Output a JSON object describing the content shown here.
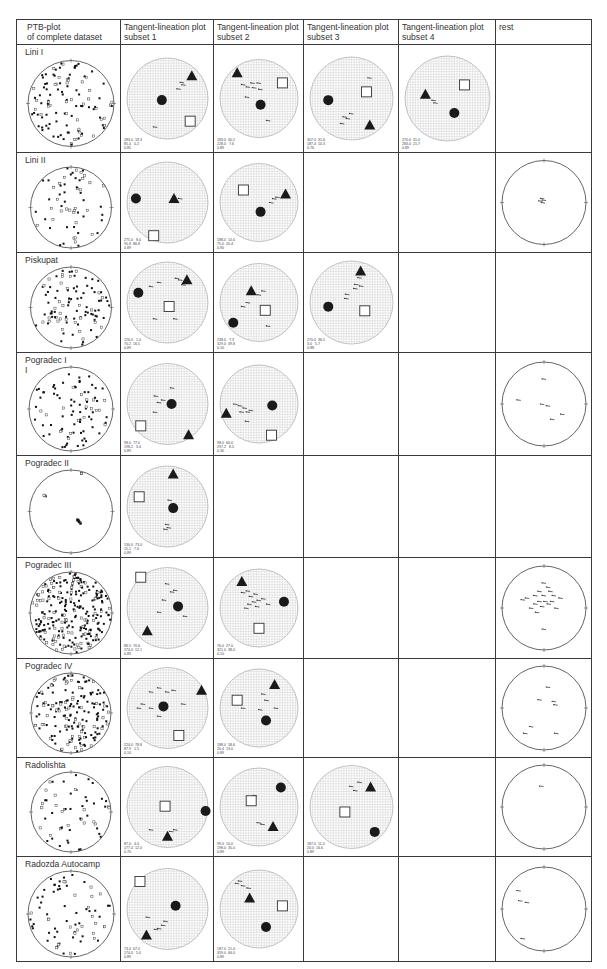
{
  "header": {
    "columns": [
      {
        "label": "PTB-plot\nof complete dataset"
      },
      {
        "label": "Tangent-lineation plot\nsubset 1"
      },
      {
        "label": "Tangent-lineation plot\nsubset 2"
      },
      {
        "label": "Tangent-lineation plot\nsubset 3"
      },
      {
        "label": "Tangent-lineation plot\nsubset 4"
      },
      {
        "label": "rest"
      }
    ]
  },
  "layout": {
    "col_widths": [
      104,
      93,
      90,
      95,
      97,
      96
    ],
    "row_heights": [
      107,
      99,
      99,
      102,
      101,
      100,
      98,
      98,
      104
    ]
  },
  "colors": {
    "border": "#3a3a3a",
    "grid": "#c8c8c8",
    "marker": "#1a1a1a",
    "circle_outline": "#555555"
  },
  "rows": [
    {
      "label": "Lini I",
      "ptb": {
        "density": 110,
        "seed": 11,
        "squares_ratio": 0.3
      },
      "subsets": [
        {
          "circle": [
            0.43,
            0.52
          ],
          "triangle": [
            0.8,
            0.22
          ],
          "square": [
            0.78,
            0.78
          ],
          "ticks": [
            [
              0.68,
              0.3
            ],
            [
              0.7,
              0.33
            ],
            [
              0.64,
              0.38
            ],
            [
              0.35,
              0.85
            ]
          ],
          "stats": "283.0  18.3\n85.4   0.2\n0.85"
        },
        {
          "circle": [
            0.52,
            0.58
          ],
          "triangle": [
            0.22,
            0.17
          ],
          "square": [
            0.8,
            0.3
          ],
          "ticks": [
            [
              0.3,
              0.32
            ],
            [
              0.36,
              0.35
            ],
            [
              0.42,
              0.3
            ],
            [
              0.44,
              0.36
            ],
            [
              0.5,
              0.3
            ],
            [
              0.52,
              0.38
            ],
            [
              0.35,
              0.48
            ],
            [
              0.62,
              0.78
            ]
          ],
          "stats": "183.0  40.2\n228.0   7.6\n0.89"
        },
        {
          "circle": [
            0.22,
            0.52
          ],
          "triangle": [
            0.72,
            0.82
          ],
          "square": [
            0.68,
            0.42
          ],
          "ticks": [
            [
              0.72,
              0.25
            ],
            [
              0.5,
              0.68
            ],
            [
              0.42,
              0.72
            ],
            [
              0.46,
              0.74
            ],
            [
              0.39,
              0.8
            ]
          ],
          "stats": "307.0  31.6\n187.4  10.3\n0.76"
        },
        {
          "circle": [
            0.58,
            0.67
          ],
          "triangle": [
            0.24,
            0.45
          ],
          "square": [
            0.7,
            0.34
          ],
          "ticks": [
            [
              0.34,
              0.52
            ],
            [
              0.36,
              0.55
            ]
          ],
          "stats": "270.0  31.0\n283.0  21.7\n0.89"
        },
        null
      ]
    },
    {
      "label": "Lini II",
      "ptb": {
        "density": 60,
        "seed": 22,
        "squares_ratio": 0.3
      },
      "subsets": [
        {
          "circle": [
            0.11,
            0.45
          ],
          "triangle": [
            0.58,
            0.45
          ],
          "square": [
            0.33,
            0.91
          ],
          "ticks": [
            [
              0.66,
              0.45
            ]
          ],
          "stats": "275.0   8.0\n95.8  86.8\n0.89"
        },
        {
          "circle": [
            0.52,
            0.62
          ],
          "triangle": [
            0.84,
            0.39
          ],
          "square": [
            0.3,
            0.34
          ],
          "ticks": [
            [
              0.7,
              0.45
            ],
            [
              0.74,
              0.43
            ],
            [
              0.66,
              0.5
            ]
          ],
          "stats": "188.0  10.0\n75.0  20.4\n0.90"
        },
        null,
        null,
        {
          "rest_ticks": [
            [
              0.48,
              0.45
            ],
            [
              0.5,
              0.47
            ],
            [
              0.46,
              0.48
            ],
            [
              0.49,
              0.5
            ]
          ]
        }
      ]
    },
    {
      "label": "Piskupat",
      "ptb": {
        "density": 100,
        "seed": 33,
        "squares_ratio": 0.35
      },
      "subsets": [
        {
          "circle": [
            0.14,
            0.38
          ],
          "triangle": [
            0.74,
            0.22
          ],
          "square": [
            0.52,
            0.55
          ],
          "ticks": [
            [
              0.62,
              0.2
            ],
            [
              0.66,
              0.22
            ],
            [
              0.7,
              0.28
            ],
            [
              0.3,
              0.3
            ],
            [
              0.4,
              0.25
            ],
            [
              0.6,
              0.7
            ],
            [
              0.35,
              0.7
            ]
          ],
          "stats": "226.0   1.0\n70.2  16.5\n0.89"
        },
        {
          "circle": [
            0.17,
            0.76
          ],
          "triangle": [
            0.4,
            0.35
          ],
          "square": [
            0.58,
            0.6
          ],
          "ticks": [
            [
              0.36,
              0.5
            ],
            [
              0.3,
              0.55
            ],
            [
              0.5,
              0.4
            ],
            [
              0.56,
              0.35
            ],
            [
              0.62,
              0.8
            ]
          ],
          "stats": "238.0   7.3\n329.0  39.8\n0.10"
        },
        {
          "circle": [
            0.22,
            0.55
          ],
          "triangle": [
            0.61,
            0.12
          ],
          "square": [
            0.66,
            0.6
          ],
          "ticks": [
            [
              0.6,
              0.2
            ],
            [
              0.56,
              0.28
            ],
            [
              0.62,
              0.3
            ],
            [
              0.55,
              0.33
            ],
            [
              0.45,
              0.4
            ],
            [
              0.44,
              0.45
            ]
          ],
          "stats": "270.0  36.5\n3.0   5.7\n0.88"
        },
        null,
        null
      ]
    },
    {
      "label": "Pogradec I\nI",
      "ptb": {
        "density": 85,
        "seed": 44,
        "squares_ratio": 0.3
      },
      "subsets": [
        {
          "circle": [
            0.55,
            0.5
          ],
          "triangle": [
            0.76,
            0.88
          ],
          "square": [
            0.17,
            0.77
          ],
          "ticks": [
            [
              0.36,
              0.4
            ],
            [
              0.4,
              0.48
            ],
            [
              0.45,
              0.45
            ],
            [
              0.35,
              0.6
            ],
            [
              0.56,
              0.3
            ]
          ],
          "stats": "98.0  77.0\n198.2   3.4\n0.89"
        },
        {
          "circle": [
            0.67,
            0.52
          ],
          "triangle": [
            0.08,
            0.62
          ],
          "square": [
            0.66,
            0.9
          ],
          "ticks": [
            [
              0.2,
              0.5
            ],
            [
              0.26,
              0.52
            ],
            [
              0.32,
              0.55
            ],
            [
              0.36,
              0.6
            ],
            [
              0.28,
              0.6
            ],
            [
              0.4,
              0.58
            ],
            [
              0.35,
              0.72
            ]
          ],
          "stats": "98.0  60.0\n297.2   8.5\n0.30"
        },
        null,
        null,
        {
          "rest_ticks": [
            [
              0.5,
              0.2
            ],
            [
              0.2,
              0.45
            ],
            [
              0.48,
              0.5
            ],
            [
              0.55,
              0.52
            ],
            [
              0.72,
              0.62
            ],
            [
              0.6,
              0.68
            ]
          ]
        }
      ]
    },
    {
      "label": "Pogradec II",
      "ptb": {
        "density": 30,
        "seed": 55,
        "squares_ratio": 0.2,
        "clustered": true
      },
      "subsets": [
        {
          "circle": [
            0.57,
            0.52
          ],
          "triangle": [
            0.57,
            0.1
          ],
          "square": [
            0.15,
            0.38
          ],
          "ticks": [
            [
              0.5,
              0.72
            ],
            [
              0.52,
              0.76
            ],
            [
              0.48,
              0.78
            ],
            [
              0.53,
              0.42
            ]
          ],
          "stats": "130.0  73.0\n15.1   7.6\n0.89"
        },
        null,
        null,
        null,
        null
      ]
    },
    {
      "label": "Pogradec III",
      "ptb": {
        "density": 260,
        "seed": 66,
        "squares_ratio": 0.3
      },
      "subsets": [
        {
          "circle": [
            0.63,
            0.48
          ],
          "triangle": [
            0.25,
            0.78
          ],
          "square": [
            0.17,
            0.12
          ],
          "ticks": [
            [
              0.5,
              0.2
            ],
            [
              0.56,
              0.3
            ],
            [
              0.6,
              0.28
            ],
            [
              0.46,
              0.4
            ],
            [
              0.4,
              0.55
            ],
            [
              0.72,
              0.6
            ]
          ],
          "stats": "86.5  70.6\n274.0  12.1\n0.89"
        },
        {
          "circle": [
            0.82,
            0.42
          ],
          "triangle": [
            0.28,
            0.16
          ],
          "square": [
            0.5,
            0.76
          ],
          "ticks": [
            [
              0.3,
              0.3
            ],
            [
              0.36,
              0.28
            ],
            [
              0.4,
              0.35
            ],
            [
              0.46,
              0.32
            ],
            [
              0.5,
              0.4
            ],
            [
              0.44,
              0.42
            ],
            [
              0.38,
              0.45
            ],
            [
              0.56,
              0.38
            ],
            [
              0.62,
              0.45
            ],
            [
              0.34,
              0.5
            ],
            [
              0.48,
              0.48
            ]
          ],
          "stats": "76.0  27.0\n321.0  38.0\n0.10"
        },
        null,
        null,
        {
          "rest_ticks": [
            [
              0.5,
              0.2
            ],
            [
              0.55,
              0.25
            ],
            [
              0.45,
              0.3
            ],
            [
              0.4,
              0.35
            ],
            [
              0.5,
              0.35
            ],
            [
              0.58,
              0.3
            ],
            [
              0.62,
              0.35
            ],
            [
              0.3,
              0.38
            ],
            [
              0.25,
              0.4
            ],
            [
              0.45,
              0.42
            ],
            [
              0.52,
              0.42
            ],
            [
              0.56,
              0.45
            ],
            [
              0.4,
              0.45
            ],
            [
              0.48,
              0.48
            ],
            [
              0.6,
              0.42
            ],
            [
              0.7,
              0.38
            ],
            [
              0.65,
              0.5
            ],
            [
              0.35,
              0.5
            ],
            [
              0.42,
              0.55
            ],
            [
              0.5,
              0.75
            ]
          ]
        }
      ]
    },
    {
      "label": "Pogradec IV",
      "ptb": {
        "density": 170,
        "seed": 77,
        "squares_ratio": 0.3
      },
      "subsets": [
        {
          "circle": [
            0.45,
            0.48
          ],
          "triangle": [
            0.92,
            0.28
          ],
          "square": [
            0.64,
            0.84
          ],
          "ticks": [
            [
              0.3,
              0.3
            ],
            [
              0.4,
              0.25
            ],
            [
              0.5,
              0.3
            ],
            [
              0.58,
              0.28
            ],
            [
              0.2,
              0.45
            ],
            [
              0.3,
              0.5
            ],
            [
              0.15,
              0.5
            ],
            [
              0.7,
              0.45
            ],
            [
              0.4,
              0.6
            ]
          ],
          "stats": "224.0  78.8\n87.9   1.5\n0.10"
        },
        {
          "circle": [
            0.59,
            0.66
          ],
          "triangle": [
            0.7,
            0.2
          ],
          "square": [
            0.22,
            0.4
          ],
          "ticks": [
            [
              0.56,
              0.32
            ],
            [
              0.6,
              0.4
            ],
            [
              0.3,
              0.5
            ],
            [
              0.52,
              0.52
            ],
            [
              0.72,
              0.5
            ]
          ],
          "stats": "188.0  58.6\n20.4  13.0\n0.89"
        },
        null,
        null,
        {
          "rest_ticks": [
            [
              0.55,
              0.25
            ],
            [
              0.45,
              0.4
            ],
            [
              0.62,
              0.42
            ],
            [
              0.64,
              0.46
            ],
            [
              0.35,
              0.72
            ],
            [
              0.28,
              0.8
            ],
            [
              0.65,
              0.8
            ]
          ]
        }
      ]
    },
    {
      "label": "Radolishta",
      "ptb": {
        "density": 55,
        "seed": 88,
        "squares_ratio": 0.4
      },
      "subsets": [
        {
          "circle": [
            0.97,
            0.55
          ],
          "triangle": [
            0.5,
            0.86
          ],
          "square": [
            0.47,
            0.49
          ],
          "ticks": [
            [
              0.55,
              0.8
            ],
            [
              0.6,
              0.78
            ],
            [
              0.3,
              0.78
            ]
          ],
          "stats": "87.0   4.0\n177.4  12.0\n0.70"
        },
        {
          "circle": [
            0.78,
            0.25
          ],
          "triangle": [
            0.68,
            0.75
          ],
          "square": [
            0.4,
            0.42
          ],
          "ticks": [
            [
              0.5,
              0.7
            ],
            [
              0.55,
              0.72
            ],
            [
              0.45,
              0.35
            ]
          ],
          "stats": "99.0  10.0\n198.0  35.0\n0.89"
        },
        {
          "circle": [
            0.78,
            0.8
          ],
          "triangle": [
            0.73,
            0.26
          ],
          "square": [
            0.42,
            0.56
          ],
          "ticks": [
            [
              0.6,
              0.2
            ],
            [
              0.55,
              0.3
            ],
            [
              0.5,
              0.25
            ]
          ],
          "stats": "187.0  11.0\n20.0  16.6\n0.89"
        },
        null,
        {
          "rest_ticks": [
            [
              0.47,
              0.25
            ]
          ]
        }
      ]
    },
    {
      "label": "Radozda Autocamp",
      "ptb": {
        "density": 70,
        "seed": 99,
        "squares_ratio": 0.3
      },
      "subsets": [
        {
          "circle": [
            0.6,
            0.46
          ],
          "triangle": [
            0.24,
            0.82
          ],
          "square": [
            0.16,
            0.16
          ],
          "ticks": [
            [
              0.26,
              0.6
            ],
            [
              0.48,
              0.65
            ],
            [
              0.45,
              0.7
            ],
            [
              0.4,
              0.74
            ],
            [
              0.36,
              0.75
            ]
          ],
          "stats": "73.0  67.0\n174.0   5.0\n0.89"
        },
        {
          "circle": [
            0.59,
            0.73
          ],
          "triangle": [
            0.38,
            0.36
          ],
          "square": [
            0.8,
            0.46
          ],
          "ticks": [
            [
              0.22,
              0.17
            ],
            [
              0.26,
              0.14
            ],
            [
              0.3,
              0.2
            ],
            [
              0.37,
              0.23
            ]
          ],
          "stats": "187.0  21.0\n359.0  66.0\n0.89"
        },
        null,
        null,
        {
          "rest_ticks": [
            [
              0.2,
              0.28
            ],
            [
              0.22,
              0.4
            ],
            [
              0.3,
              0.42
            ],
            [
              0.25,
              0.85
            ]
          ]
        }
      ]
    }
  ]
}
